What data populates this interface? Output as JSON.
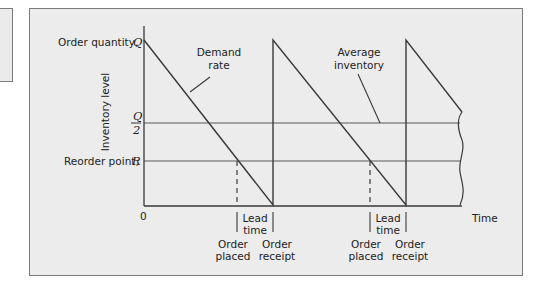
{
  "diagram": {
    "y_axis": {
      "title": "Inventory level",
      "labels": {
        "order_quantity": "Order quantity,",
        "order_quantity_symbol": "Q",
        "half_q_num": "Q",
        "half_q_den": "2",
        "reorder_point": "Reorder point,",
        "reorder_point_symbol": "R",
        "origin": "0"
      }
    },
    "x_axis": {
      "title": "Time"
    },
    "annotations": {
      "demand_rate_1": "Demand",
      "demand_rate_2": "rate",
      "average_inventory_1": "Average",
      "average_inventory_2": "inventory"
    },
    "cycles": [
      {
        "lead_time_1": "Lead",
        "lead_time_2": "time",
        "order_placed_1": "Order",
        "order_placed_2": "placed",
        "order_receipt_1": "Order",
        "order_receipt_2": "receipt"
      },
      {
        "lead_time_1": "Lead",
        "lead_time_2": "time",
        "order_placed_1": "Order",
        "order_placed_2": "placed",
        "order_receipt_1": "Order",
        "order_receipt_2": "receipt"
      }
    ],
    "colors": {
      "line": "#3a3a3a",
      "reference_line": "#8a8a8a",
      "background": "#ececec"
    }
  }
}
